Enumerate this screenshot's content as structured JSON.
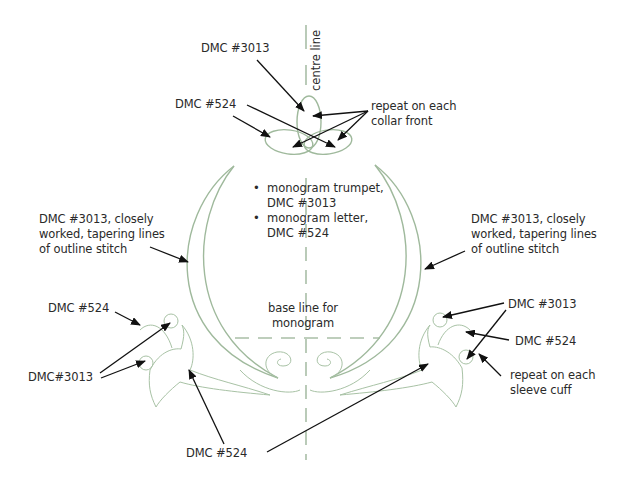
{
  "diagram": {
    "colors": {
      "motif_stroke": "#9fb99c",
      "guide_line": "#a9bea7",
      "arrow": "#111111",
      "text": "#2a2a2a",
      "background": "#ffffff"
    },
    "labels": {
      "centre_line": "centre line",
      "collar_dmc3013": "DMC #3013",
      "collar_dmc524": "DMC #524",
      "collar_repeat_line1": "repeat on each",
      "collar_repeat_line2": "collar front",
      "left_outline_line1": "DMC #3013, closely",
      "left_outline_line2": "worked, tapering lines",
      "left_outline_line3": "of outline stitch",
      "right_outline_line1": "DMC #3013, closely",
      "right_outline_line2": "worked, tapering lines",
      "right_outline_line3": "of outline stitch",
      "left_cuff_dmc524": "DMC #524",
      "left_cuff_dmc3013": "DMC#3013",
      "right_cuff_dmc3013": "DMC #3013",
      "right_cuff_dmc524": "DMC #524",
      "cuff_repeat_line1": "repeat on each",
      "cuff_repeat_line2": "sleeve cuff",
      "baseline_line1": "base line for",
      "baseline_line2": "monogram",
      "bottom_dmc524": "DMC #524"
    },
    "bullets": [
      {
        "line1": "monogram trumpet,",
        "line2": "DMC #3013"
      },
      {
        "line1": "monogram letter,",
        "line2": "DMC #524"
      }
    ]
  }
}
